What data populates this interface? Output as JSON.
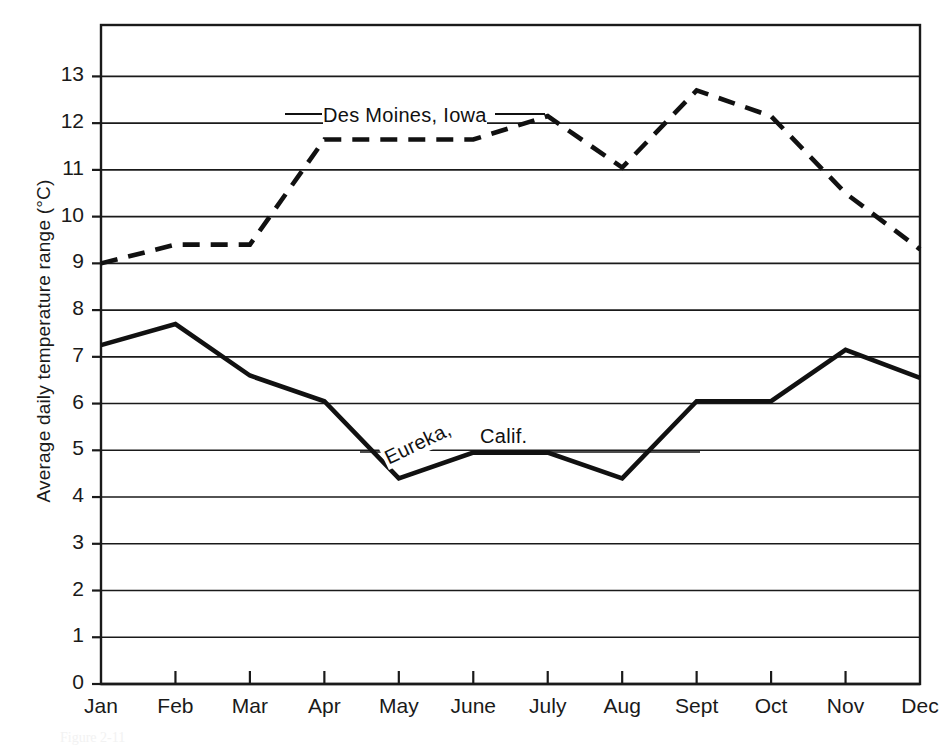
{
  "figure": {
    "caption": "Figure 2-11"
  },
  "axes": {
    "y_title": "Average daily temperature range (°C)",
    "y_ticks": [
      "0",
      "1",
      "2",
      "3",
      "4",
      "5",
      "6",
      "7",
      "8",
      "9",
      "10",
      "11",
      "12",
      "13"
    ],
    "x_ticks": [
      "Jan",
      "Feb",
      "Mar",
      "Apr",
      "May",
      "June",
      "July",
      "Aug",
      "Sept",
      "Oct",
      "Nov",
      "Dec"
    ]
  },
  "annotations": {
    "des_moines": "Des Moines, Iowa",
    "eureka_city": "Eureka,",
    "eureka_state": "Calif."
  },
  "colors": {
    "ink": "#111111",
    "grid": "#1a1a1a",
    "background": "#ffffff"
  },
  "chart_data": {
    "type": "line",
    "title": "",
    "xlabel": "",
    "ylabel": "Average daily temperature range (°C)",
    "categories": [
      "Jan",
      "Feb",
      "Mar",
      "Apr",
      "May",
      "June",
      "July",
      "Aug",
      "Sept",
      "Oct",
      "Nov",
      "Dec"
    ],
    "ylim": [
      0,
      14.1
    ],
    "yticks": [
      0,
      1,
      2,
      3,
      4,
      5,
      6,
      7,
      8,
      9,
      10,
      11,
      12,
      13
    ],
    "grid": true,
    "legend": "inline-labels",
    "series": [
      {
        "name": "Des Moines, Iowa",
        "style": "dashed",
        "values": [
          9.0,
          9.4,
          9.4,
          11.65,
          11.65,
          11.65,
          12.15,
          11.05,
          12.7,
          12.15,
          10.5,
          9.3
        ]
      },
      {
        "name": "Eureka, Calif.",
        "style": "solid",
        "values": [
          7.25,
          7.7,
          6.6,
          6.05,
          4.4,
          4.95,
          4.95,
          4.4,
          6.05,
          6.05,
          7.15,
          6.55
        ]
      }
    ]
  }
}
